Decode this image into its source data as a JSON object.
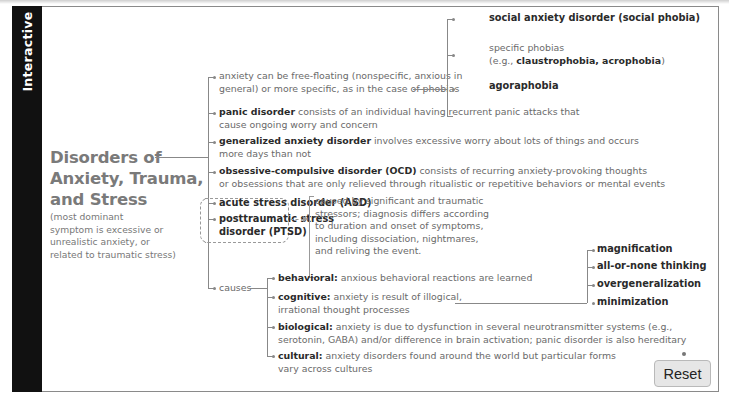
{
  "sidebar": {
    "label": "Interactive"
  },
  "root": {
    "title_lines": [
      "Disorders of",
      "Anxiety, Trauma,",
      "and Stress"
    ],
    "subtitle_lines": [
      "(most dominant",
      "symptom is excessive or",
      "unrealistic anxiety, or",
      "related to traumatic stress)"
    ]
  },
  "branches": {
    "anxiety": {
      "lines": [
        "anxiety can be free-floating (nonspecific, anxious in",
        "general) or more specific, as in the case of phobias"
      ],
      "phobias": {
        "social": "social anxiety disorder (social phobia)",
        "specific_line1": "specific phobias",
        "specific_prefix": "(e.g., ",
        "specific_bold": "claustrophobia, acrophobia",
        "specific_suffix": ")",
        "agoraphobia": "agoraphobia"
      }
    },
    "panic": {
      "term": "panic disorder",
      "desc1": " consists of an individual having recurrent panic attacks that",
      "desc2": "cause ongoing worry and concern"
    },
    "gad": {
      "term": "generalized anxiety disorder",
      "desc1": " involves excessive worry about lots of things and occurs",
      "desc2": "more days than not"
    },
    "ocd": {
      "term": "obsessive-compulsive disorder (OCD)",
      "desc1": " consists of recurring anxiety-provoking thoughts",
      "desc2": "or obsessions that are only relieved through ritualistic or repetitive behaviors or mental events"
    },
    "trauma": {
      "asd": "acute stress disorder (ASD)",
      "ptsd_line1": "posttraumatic stress",
      "ptsd_line2": "disorder (PTSD)",
      "description_lines": [
        "caused by significant and traumatic",
        "stressors; diagnosis differs according",
        "to duration and onset of symptoms,",
        "including dissociation, nightmares,",
        "and reliving the event."
      ]
    },
    "causes": {
      "label": "causes",
      "behavioral": {
        "term": "behavioral:",
        "desc": " anxious behavioral reactions are learned"
      },
      "cognitive": {
        "term": "cognitive:",
        "desc1": " anxiety is result of illogical,",
        "desc2": "irrational thought processes",
        "distortions": [
          "magnification",
          "all-or-none thinking",
          "overgeneralization",
          "minimization"
        ]
      },
      "biological": {
        "term": "biological:",
        "desc1": " anxiety is due to dysfunction in several neurotransmitter systems (e.g.,",
        "desc2": "serotonin, GABA) and/or difference in brain activation; panic disorder is also hereditary"
      },
      "cultural": {
        "term": "cultural:",
        "desc1": " anxiety disorders found around the world but particular forms",
        "desc2": "vary across cultures"
      }
    }
  },
  "controls": {
    "reset_label": "Reset"
  },
  "colors": {
    "sidebar": "#111111",
    "title": "#7a7a7a",
    "bold_text": "#2a2a2a",
    "body_text": "#6a6a6a",
    "connector": "#888888",
    "button_bg": "#e6e6e6"
  }
}
